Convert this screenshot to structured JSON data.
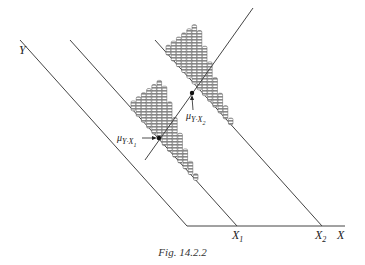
{
  "figure": {
    "caption": "Fig. 14.2.2",
    "labels": {
      "y_axis": "Y",
      "x_axis": "X",
      "x1": "X",
      "x1_sub": "1",
      "x2": "X",
      "x2_sub": "2",
      "mu1_main": "μ",
      "mu1_sub": "Y·X",
      "mu1_subsub": "1",
      "mu2_main": "μ",
      "mu2_sub": "Y·X",
      "mu2_subsub": "2"
    },
    "colors": {
      "line": "#444444",
      "bar_fill": "#9a9a9a",
      "bar_stripe": "#ffffff",
      "background": "#ffffff"
    },
    "histograms": [
      {
        "name": "distribution-at-x1",
        "column_heights": [
          3,
          6,
          9,
          12,
          15,
          18,
          18,
          15,
          12,
          9,
          6,
          4,
          2
        ]
      },
      {
        "name": "distribution-at-x2",
        "column_heights": [
          3,
          6,
          9,
          12,
          15,
          18,
          18,
          15,
          12,
          9,
          6,
          4,
          2
        ]
      }
    ]
  }
}
